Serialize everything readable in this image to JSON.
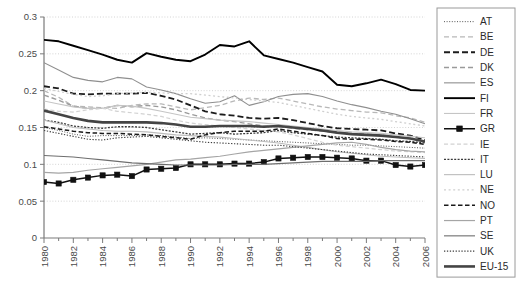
{
  "chart_data": {
    "type": "line",
    "title": "",
    "xlabel": "",
    "ylabel": "",
    "xlim": [
      1980,
      2006
    ],
    "ylim": [
      0,
      0.3
    ],
    "grid": true,
    "legend_position": "right",
    "ytick_labels": [
      "0.3",
      "0.25",
      "0.2",
      "0.15",
      "0.1",
      "0.05",
      "0"
    ],
    "ytick_values": [
      0.3,
      0.25,
      0.2,
      0.15,
      0.1,
      0.05,
      0
    ],
    "xtick_labels": [
      "1980",
      "1982",
      "1984",
      "1986",
      "1988",
      "1990",
      "1992",
      "1994",
      "1996",
      "1998",
      "2000",
      "2002",
      "2004",
      "2006"
    ],
    "xtick_values": [
      1980,
      1982,
      1984,
      1986,
      1988,
      1990,
      1992,
      1994,
      1996,
      1998,
      2000,
      2002,
      2004,
      2006
    ],
    "x": [
      1980,
      1981,
      1982,
      1983,
      1984,
      1985,
      1986,
      1987,
      1988,
      1989,
      1990,
      1991,
      1992,
      1993,
      1994,
      1995,
      1996,
      1997,
      1998,
      1999,
      2000,
      2001,
      2002,
      2003,
      2004,
      2005,
      2006
    ],
    "series": [
      {
        "name": "AT",
        "color": "#555555",
        "width": 1.0,
        "dash": "1,1.6",
        "marker": "none",
        "values": [
          0.15,
          0.146,
          0.141,
          0.138,
          0.139,
          0.139,
          0.139,
          0.14,
          0.139,
          0.137,
          0.135,
          0.136,
          0.135,
          0.134,
          0.133,
          0.132,
          0.131,
          0.13,
          0.129,
          0.128,
          0.127,
          0.126,
          0.126,
          0.125,
          0.124,
          0.123,
          0.122
        ]
      },
      {
        "name": "BE",
        "color": "#b8b8b8",
        "width": 1.3,
        "dash": "5,3",
        "marker": "none",
        "values": [
          0.2,
          0.191,
          0.179,
          0.178,
          0.177,
          0.176,
          0.18,
          0.182,
          0.182,
          0.178,
          0.174,
          0.177,
          0.18,
          0.186,
          0.19,
          0.188,
          0.19,
          0.186,
          0.182,
          0.178,
          0.175,
          0.173,
          0.171,
          0.17,
          0.166,
          0.163,
          0.157
        ]
      },
      {
        "name": "DE",
        "color": "#1c1c1c",
        "width": 1.8,
        "dash": "6,3",
        "marker": "none",
        "values": [
          0.206,
          0.203,
          0.196,
          0.195,
          0.196,
          0.196,
          0.196,
          0.197,
          0.193,
          0.188,
          0.18,
          0.172,
          0.168,
          0.166,
          0.163,
          0.162,
          0.163,
          0.16,
          0.156,
          0.152,
          0.149,
          0.148,
          0.147,
          0.146,
          0.142,
          0.139,
          0.133
        ]
      },
      {
        "name": "DK",
        "color": "#9a9a9a",
        "width": 1.4,
        "dash": "5,3",
        "marker": "none",
        "values": [
          0.194,
          0.187,
          0.179,
          0.176,
          0.176,
          0.18,
          0.178,
          0.18,
          0.178,
          0.174,
          0.168,
          0.163,
          0.16,
          0.158,
          0.155,
          0.152,
          0.151,
          0.149,
          0.147,
          0.145,
          0.143,
          0.142,
          0.141,
          0.14,
          0.137,
          0.135,
          0.131
        ]
      },
      {
        "name": "ES",
        "color": "#8f8f8f",
        "width": 1.1,
        "dash": "none",
        "marker": "none",
        "values": [
          0.238,
          0.228,
          0.218,
          0.214,
          0.212,
          0.218,
          0.216,
          0.205,
          0.201,
          0.196,
          0.189,
          0.183,
          0.185,
          0.193,
          0.18,
          0.185,
          0.192,
          0.195,
          0.196,
          0.192,
          0.186,
          0.181,
          0.177,
          0.172,
          0.168,
          0.162,
          0.155
        ]
      },
      {
        "name": "FI",
        "color": "#000000",
        "width": 1.9,
        "dash": "none",
        "marker": "none",
        "values": [
          0.269,
          0.267,
          0.261,
          0.255,
          0.249,
          0.242,
          0.238,
          0.251,
          0.246,
          0.242,
          0.24,
          0.249,
          0.262,
          0.26,
          0.267,
          0.248,
          0.243,
          0.238,
          0.232,
          0.226,
          0.208,
          0.206,
          0.21,
          0.215,
          0.209,
          0.201,
          0.2
        ]
      },
      {
        "name": "FR",
        "color": "#c5c5c5",
        "width": 1.1,
        "dash": "none",
        "marker": "none",
        "values": [
          0.186,
          0.182,
          0.178,
          0.176,
          0.176,
          0.18,
          0.179,
          0.176,
          0.172,
          0.168,
          0.164,
          0.162,
          0.16,
          0.159,
          0.158,
          0.156,
          0.154,
          0.152,
          0.15,
          0.148,
          0.146,
          0.144,
          0.143,
          0.142,
          0.14,
          0.138,
          0.136
        ]
      },
      {
        "name": "GR",
        "color": "#111111",
        "width": 1.5,
        "dash": "none",
        "marker": "square",
        "values": [
          0.076,
          0.074,
          0.079,
          0.082,
          0.085,
          0.086,
          0.084,
          0.093,
          0.094,
          0.095,
          0.1,
          0.1,
          0.1,
          0.101,
          0.101,
          0.103,
          0.108,
          0.109,
          0.11,
          0.11,
          0.109,
          0.108,
          0.105,
          0.105,
          0.099,
          0.097,
          0.099
        ]
      },
      {
        "name": "IE",
        "color": "#d2d2d2",
        "width": 1.2,
        "dash": "4,2.5",
        "marker": "none",
        "values": [
          0.175,
          0.172,
          0.171,
          0.174,
          0.176,
          0.172,
          0.17,
          0.168,
          0.165,
          0.16,
          0.156,
          0.154,
          0.152,
          0.15,
          0.148,
          0.146,
          0.144,
          0.14,
          0.135,
          0.13,
          0.126,
          0.124,
          0.122,
          0.12,
          0.118,
          0.117,
          0.116
        ]
      },
      {
        "name": "IT",
        "color": "#3a3a3a",
        "width": 1.3,
        "dash": "2,1.4",
        "marker": "none",
        "values": [
          0.16,
          0.157,
          0.152,
          0.15,
          0.149,
          0.151,
          0.151,
          0.15,
          0.147,
          0.144,
          0.141,
          0.142,
          0.143,
          0.141,
          0.142,
          0.143,
          0.146,
          0.143,
          0.141,
          0.139,
          0.137,
          0.136,
          0.135,
          0.134,
          0.132,
          0.131,
          0.129
        ]
      },
      {
        "name": "LU",
        "color": "#bcbcbc",
        "width": 1.1,
        "dash": "none",
        "marker": "none",
        "values": [
          0.16,
          0.155,
          0.15,
          0.148,
          0.146,
          0.145,
          0.145,
          0.144,
          0.142,
          0.14,
          0.139,
          0.138,
          0.137,
          0.135,
          0.133,
          0.131,
          0.129,
          0.126,
          0.123,
          0.12,
          0.117,
          0.115,
          0.113,
          0.111,
          0.11,
          0.109,
          0.108
        ]
      },
      {
        "name": "NE",
        "color": "#cfcfcf",
        "width": 1.3,
        "dash": "2,2.6",
        "marker": "none",
        "values": [
          0.203,
          0.199,
          0.195,
          0.192,
          0.193,
          0.196,
          0.197,
          0.198,
          0.197,
          0.196,
          0.196,
          0.194,
          0.192,
          0.19,
          0.188,
          0.186,
          0.184,
          0.18,
          0.176,
          0.172,
          0.168,
          0.165,
          0.163,
          0.161,
          0.158,
          0.155,
          0.152
        ]
      },
      {
        "name": "NO",
        "color": "#1a1a1a",
        "width": 1.5,
        "dash": "4.5,2.5",
        "marker": "none",
        "values": [
          0.151,
          0.148,
          0.145,
          0.143,
          0.142,
          0.142,
          0.141,
          0.14,
          0.138,
          0.136,
          0.134,
          0.14,
          0.143,
          0.145,
          0.145,
          0.145,
          0.148,
          0.145,
          0.142,
          0.139,
          0.135,
          0.134,
          0.134,
          0.133,
          0.131,
          0.13,
          0.127
        ]
      },
      {
        "name": "PT",
        "color": "#a5a5a5",
        "width": 1.2,
        "dash": "none",
        "marker": "none",
        "values": [
          0.089,
          0.088,
          0.089,
          0.092,
          0.094,
          0.096,
          0.098,
          0.1,
          0.103,
          0.106,
          0.107,
          0.109,
          0.111,
          0.114,
          0.117,
          0.119,
          0.121,
          0.123,
          0.125,
          0.127,
          0.129,
          0.13,
          0.127,
          0.123,
          0.12,
          0.118,
          0.117
        ]
      },
      {
        "name": "SE",
        "color": "#6e6e6e",
        "width": 1.1,
        "dash": "none",
        "marker": "none",
        "values": [
          0.112,
          0.111,
          0.11,
          0.108,
          0.106,
          0.104,
          0.102,
          0.101,
          0.1,
          0.099,
          0.099,
          0.099,
          0.099,
          0.1,
          0.1,
          0.1,
          0.101,
          0.102,
          0.103,
          0.104,
          0.104,
          0.104,
          0.104,
          0.105,
          0.105,
          0.105,
          0.105
        ]
      },
      {
        "name": "UK",
        "color": "#3d3d3d",
        "width": 1.1,
        "dash": "1.3,1.6",
        "marker": "none",
        "values": [
          0.146,
          0.142,
          0.138,
          0.134,
          0.133,
          0.136,
          0.137,
          0.138,
          0.136,
          0.134,
          0.132,
          0.13,
          0.129,
          0.128,
          0.127,
          0.126,
          0.126,
          0.124,
          0.122,
          0.12,
          0.118,
          0.116,
          0.114,
          0.113,
          0.112,
          0.111,
          0.11
        ]
      },
      {
        "name": "EU-15",
        "color": "#444444",
        "width": 2.6,
        "dash": "none",
        "marker": "none",
        "values": [
          0.173,
          0.168,
          0.163,
          0.159,
          0.157,
          0.157,
          0.157,
          0.157,
          0.156,
          0.154,
          0.151,
          0.151,
          0.152,
          0.152,
          0.152,
          0.151,
          0.152,
          0.15,
          0.148,
          0.146,
          0.143,
          0.141,
          0.14,
          0.139,
          0.137,
          0.135,
          0.131
        ]
      }
    ]
  },
  "legend": {
    "entries": [
      {
        "label": "AT"
      },
      {
        "label": "BE"
      },
      {
        "label": "DE"
      },
      {
        "label": "DK"
      },
      {
        "label": "ES"
      },
      {
        "label": "FI"
      },
      {
        "label": "FR"
      },
      {
        "label": "GR"
      },
      {
        "label": "IE"
      },
      {
        "label": "IT"
      },
      {
        "label": "LU"
      },
      {
        "label": "NE"
      },
      {
        "label": "NO"
      },
      {
        "label": "PT"
      },
      {
        "label": "SE"
      },
      {
        "label": "UK"
      },
      {
        "label": "EU-15"
      }
    ]
  }
}
